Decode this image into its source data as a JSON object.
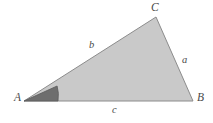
{
  "figure": {
    "kind": "geometry-diagram",
    "canvas": {
      "width": 213,
      "height": 123
    },
    "background_color": "#ffffff",
    "triangle": {
      "fill_color": "#c9c9c9",
      "stroke_color": "#8c8c8c",
      "stroke_width": 1,
      "points": "24,101 193,101 156,17",
      "vertices": [
        {
          "name": "A",
          "x": 24,
          "y": 101
        },
        {
          "name": "B",
          "x": 193,
          "y": 101
        },
        {
          "name": "C",
          "x": 156,
          "y": 17
        }
      ]
    },
    "angle_marker": {
      "at_vertex": "A",
      "fill_color": "#6e6e6e",
      "stroke_color": "#5a5a5a",
      "path": "M 24 101 L 58 101 A 34 34 0 0 0 57.1 86.0 Z"
    },
    "vertex_labels": [
      {
        "id": "label-A",
        "text": "A"
      },
      {
        "id": "label-B",
        "text": "B"
      },
      {
        "id": "label-C",
        "text": "C"
      }
    ],
    "side_labels": [
      {
        "id": "label-a",
        "text": "a",
        "opposite_vertex": "A",
        "between": "C-B"
      },
      {
        "id": "label-b",
        "text": "b",
        "opposite_vertex": "B",
        "between": "A-C"
      },
      {
        "id": "label-c",
        "text": "c",
        "opposite_vertex": "C",
        "between": "A-B"
      }
    ],
    "labels": {
      "A": "A",
      "B": "B",
      "C": "C",
      "a": "a",
      "b": "b",
      "c": "c"
    }
  }
}
